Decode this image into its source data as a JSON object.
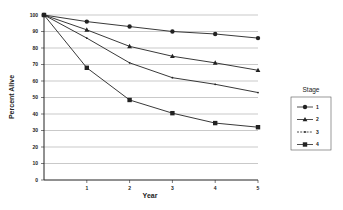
{
  "chart_data": {
    "type": "line",
    "title": "",
    "xlabel": "Year",
    "ylabel": "Percent Alive",
    "x": [
      0,
      1,
      2,
      3,
      4,
      5
    ],
    "x_tick_labels": [
      "1",
      "2",
      "3",
      "4",
      "5"
    ],
    "y_tick_labels": [
      "0",
      "10",
      "20",
      "30",
      "40",
      "50",
      "60",
      "70",
      "80",
      "90",
      "100"
    ],
    "ylim": [
      0,
      100
    ],
    "xlim": [
      0,
      5
    ],
    "grid": "horizontal",
    "legend": {
      "title": "Stage",
      "position": "right"
    },
    "series": [
      {
        "name": "1",
        "marker": "circle",
        "values": [
          100,
          96,
          93,
          90,
          88.5,
          86
        ]
      },
      {
        "name": "2",
        "marker": "triangle",
        "values": [
          100,
          91,
          81,
          75,
          71,
          66.5
        ]
      },
      {
        "name": "3",
        "marker": "dot",
        "values": [
          100,
          86,
          71,
          62,
          58,
          53
        ]
      },
      {
        "name": "4",
        "marker": "square",
        "values": [
          100,
          68,
          48.5,
          40.5,
          34.5,
          32
        ]
      }
    ]
  },
  "colors": {
    "line": "#222222",
    "grid": "#bbbbbb",
    "axis": "#222222"
  }
}
